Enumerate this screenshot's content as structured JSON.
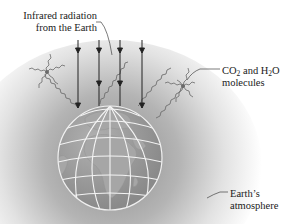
{
  "figure": {
    "labels": {
      "infrared_line1": "Infrared radiation",
      "infrared_line2": "from the Earth",
      "molecules_part1": "CO",
      "molecules_sub1": "2",
      "molecules_part2": " and H",
      "molecules_sub2": "2",
      "molecules_part3": "O",
      "molecules_line2": "molecules",
      "atmosphere_line1": "Earth’s",
      "atmosphere_line2": "atmosphere"
    },
    "elements": {
      "arrows": 4,
      "molecule_clusters": 2,
      "globe": "Earth globe showing Africa and Europe with latitude/longitude grid"
    },
    "colors": {
      "atmosphere_shade": "#a8a8a8",
      "globe_fill": "#9a9a9a",
      "grid_lines": "#f2f2f2",
      "arrow": "#222222",
      "wave": "#6e6e6e",
      "text": "#1a1a1a"
    }
  }
}
